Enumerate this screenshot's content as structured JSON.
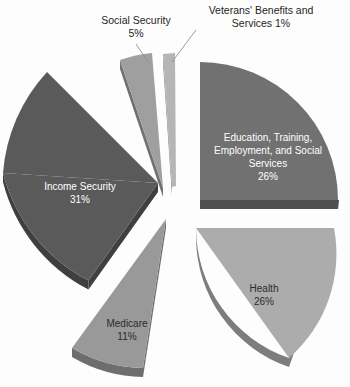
{
  "chart_data": {
    "type": "pie",
    "title": "",
    "exploded": true,
    "three_d": true,
    "legend_position": "none",
    "categories": [
      "Education, Training, Employment, and Social Services",
      "Health",
      "Medicare",
      "Income Security",
      "Social Security",
      "Veterans' Benefits and Services"
    ],
    "values": [
      26,
      26,
      11,
      31,
      5,
      1
    ],
    "slices": [
      {
        "name": "Education, Training, Employment, and Social Services",
        "label_lines": "Education, Training,\nEmployment, and Social\nServices",
        "value_label": "26%",
        "value": 26,
        "color": "#717171",
        "side_color": "#4f4f4f",
        "label_placement": "inside",
        "label_color": "#ffffff"
      },
      {
        "name": "Health",
        "label_lines": "Health",
        "value_label": "26%",
        "value": 26,
        "color": "#acacac",
        "side_color": "#7d7d7d",
        "label_placement": "inside",
        "label_color": "#2b2b2b"
      },
      {
        "name": "Medicare",
        "label_lines": "Medicare",
        "value_label": "11%",
        "value": 11,
        "color": "#999999",
        "side_color": "#6e6e6e",
        "label_placement": "inside",
        "label_color": "#2b2b2b"
      },
      {
        "name": "Income Security",
        "label_lines": "Income Security",
        "value_label": "31%",
        "value": 31,
        "color": "#5a5a5a",
        "side_color": "#3f3f3f",
        "label_placement": "inside",
        "label_color": "#ffffff"
      },
      {
        "name": "Social Security",
        "label_lines": "Social Security",
        "value_label": "5%",
        "value": 5,
        "color": "#9f9f9f",
        "side_color": "#717171",
        "label_placement": "outside",
        "label_color": "#1d1d1d"
      },
      {
        "name": "Veterans' Benefits and Services",
        "label_lines": "Veterans' Benefits and\nServices",
        "value_label": "1%",
        "value": 1,
        "color": "#b5b5b5",
        "side_color": "#838383",
        "label_placement": "outside",
        "label_color": "#1d1d1d"
      }
    ],
    "external_labels": [
      {
        "name": "social-security",
        "text": "Social Security\n5%",
        "x": 88,
        "y": 14,
        "width": 96
      },
      {
        "name": "veterans-benefits",
        "text": "Veterans' Benefits and\nServices 1%",
        "x": 196,
        "y": 4,
        "width": 130
      }
    ],
    "background": "#fdfdfd"
  }
}
